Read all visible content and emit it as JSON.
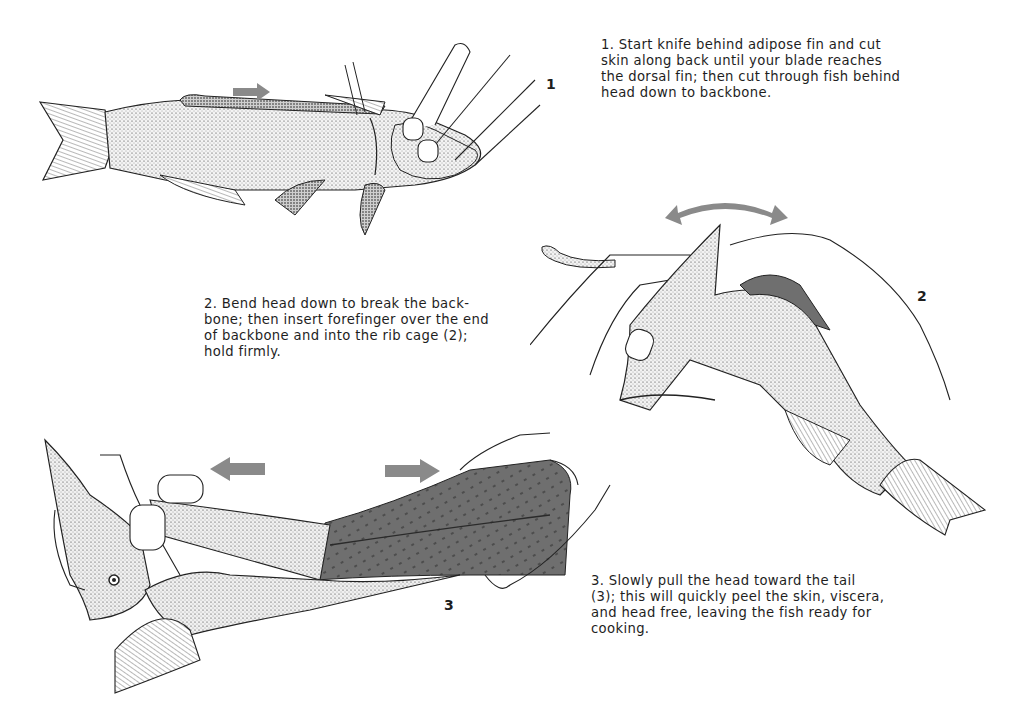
{
  "page": {
    "arrow_color": "#8a8a8a",
    "skin_color": "#6f6f6f"
  },
  "steps": [
    {
      "figure_number": "1",
      "text": "1. Start knife behind adipose fin and cut skin along back until your blade reaches the dorsal fin; then cut through fish behind head down to backbone.",
      "lines": [
        "1. Start knife behind adipose fin and cut",
        "skin along back until your blade reaches",
        "the dorsal fin; then cut through fish behind",
        "head down to backbone."
      ],
      "illustration": "fish-side-view-with-hand-and-knife",
      "arrows": [
        "arrow-right"
      ]
    },
    {
      "figure_number": "2",
      "text": "2. Bend head down to break the backbone; then insert forefinger over the end of backbone and into the rib cage (2); hold firmly.",
      "lines": [
        "2. Bend head down to break the back-",
        "bone; then insert forefinger over the end",
        "of backbone and into the rib cage (2);",
        "hold firmly."
      ],
      "illustration": "hands-bending-fish-head",
      "arrows": [
        "arrow-double-curved"
      ]
    },
    {
      "figure_number": "3",
      "text": "3. Slowly pull the head toward the tail (3); this will quickly peel the skin, viscera, and head free, leaving the fish ready for cooking.",
      "lines": [
        "3. Slowly pull the head toward the tail",
        "(3); this will quickly peel the skin, viscera,",
        "and head free, leaving the fish ready for",
        "cooking."
      ],
      "illustration": "hands-pulling-head-peeling-skin",
      "arrows": [
        "arrow-left",
        "arrow-right"
      ]
    }
  ]
}
